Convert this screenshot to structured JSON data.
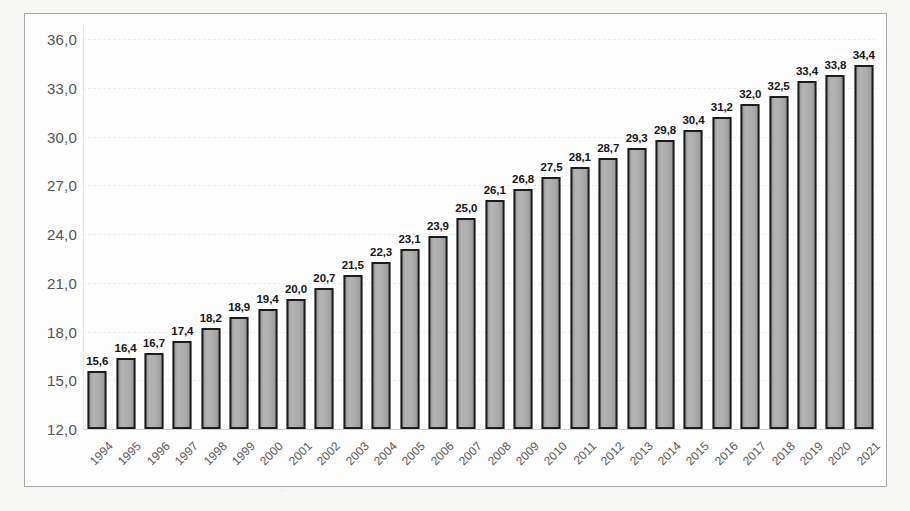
{
  "chart_data": {
    "type": "bar",
    "title": "",
    "xlabel": "",
    "ylabel": "",
    "ylim": [
      12.0,
      36.0
    ],
    "ytick_step": 3.0,
    "ytick_labels": [
      "36,0",
      "33,0",
      "30,0",
      "27,0",
      "24,0",
      "21,0",
      "18,0",
      "15,0",
      "12,0"
    ],
    "ytick_values": [
      36.0,
      33.0,
      30.0,
      27.0,
      24.0,
      21.0,
      18.0,
      15.0,
      12.0
    ],
    "grid": true,
    "legend": false,
    "decimal_separator": ",",
    "categories": [
      "1994",
      "1995",
      "1996",
      "1997",
      "1998",
      "1999",
      "2000",
      "2001",
      "2002",
      "2003",
      "2004",
      "2005",
      "2006",
      "2007",
      "2008",
      "2009",
      "2010",
      "2011",
      "2012",
      "2013",
      "2014",
      "2015",
      "2016",
      "2017",
      "2018",
      "2019",
      "2020",
      "2021"
    ],
    "values": [
      15.6,
      16.4,
      16.7,
      17.4,
      18.2,
      18.9,
      19.4,
      20.0,
      20.7,
      21.5,
      22.3,
      23.1,
      23.9,
      25.0,
      26.1,
      26.8,
      27.5,
      28.1,
      28.7,
      29.3,
      29.8,
      30.4,
      31.2,
      32.0,
      32.5,
      33.4,
      33.8,
      34.4
    ],
    "value_labels": [
      "15,6",
      "16,4",
      "16,7",
      "17,4",
      "18,2",
      "18,9",
      "19,4",
      "20,0",
      "20,7",
      "21,5",
      "22,3",
      "23,1",
      "23,9",
      "25,0",
      "26,1",
      "26,8",
      "27,5",
      "28,1",
      "28,7",
      "29,3",
      "29,8",
      "30,4",
      "31,2",
      "32,0",
      "32,5",
      "33,4",
      "33,8",
      "34,4"
    ],
    "colors": {
      "bar_fill": "#a9a9a9",
      "bar_border": "#1c1c1c",
      "value_label": "#171717",
      "axis_label": "#555555",
      "gridline": "#ededed",
      "baseline": "#d2d2d2",
      "frame_border": "#a9a9a9",
      "plot_background": "#fdfdfd",
      "page_background": "#f6f6f5"
    }
  }
}
